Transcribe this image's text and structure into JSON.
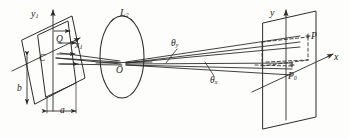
{
  "figure": {
    "kind": "optical-ray-diagram",
    "stroke_color": "#2b2b2b",
    "background_color": "#fdfdfb",
    "labels": {
      "input_axis_y": "y",
      "input_axis_y_sub": "1",
      "input_point_q": "Q",
      "input_axis_x": "x",
      "input_axis_x_sub": "1",
      "input_center_c": "C",
      "aperture_height": "b",
      "aperture_width": "a",
      "lens": "L",
      "lens_sub": "2",
      "lens_center_o": "O",
      "angle_theta_y": "θ",
      "angle_theta_y_sub": "y",
      "angle_theta_x": "θ",
      "angle_theta_x_sub": "x",
      "output_axis_y": "y",
      "output_point_p": "P",
      "output_axis_x": "x",
      "output_point_p0": "P",
      "output_point_p0_sub": "0"
    }
  }
}
